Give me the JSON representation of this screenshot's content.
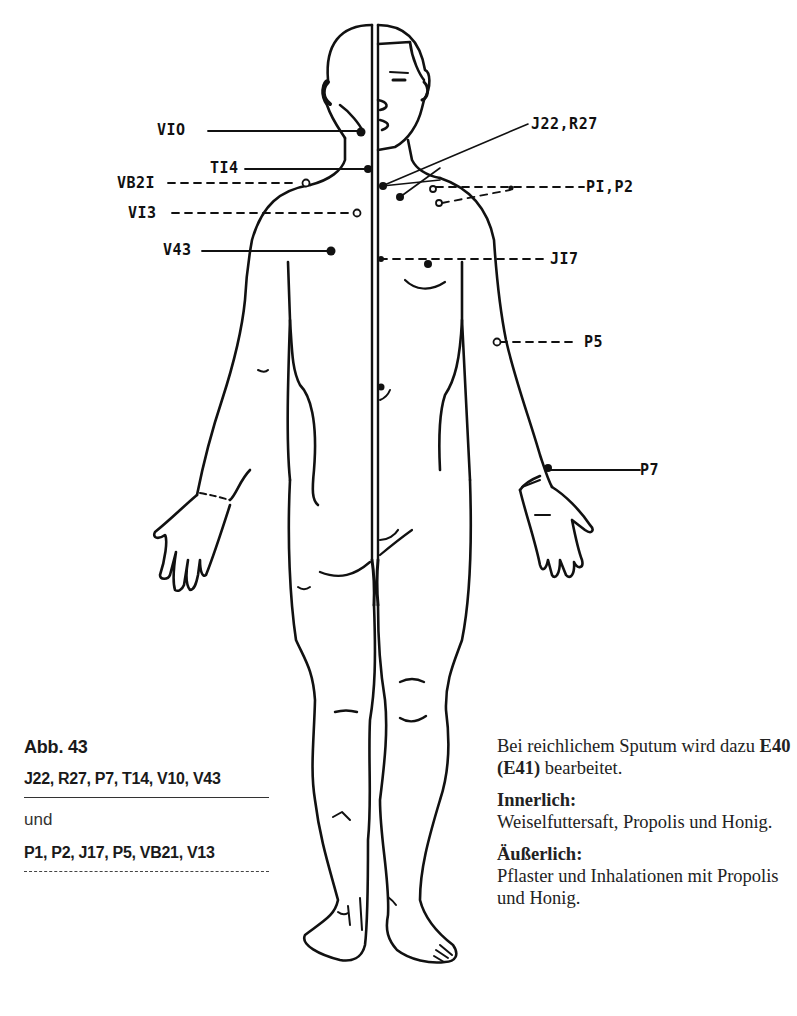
{
  "figure": {
    "labels": {
      "v10": "VIO",
      "ti4": "TI4",
      "vb21": "VB2I",
      "vi3": "VI3",
      "v43": "V43",
      "j22_r27": "J22,R27",
      "p1_p2": "PI,P2",
      "j17": "JI7",
      "p5": "P5",
      "p7": "P7"
    },
    "line_color": "#111111"
  },
  "caption": {
    "title": "Abb. 43",
    "primary_points": "J22, R27, P7, T14, V10, V43",
    "conjunction": "und",
    "secondary_points": "P1, P2, J17, P5, VB21, V13"
  },
  "side_text": {
    "sputum_line1": "Bei reichlichem Sputum wird dazu ",
    "sputum_bold": "E40 (E41)",
    "sputum_line2": " bearbeitet.",
    "internal_heading": "Innerlich:",
    "internal_text": "Weiselfuttersaft, Propolis und Honig.",
    "external_heading": "Äußerlich:",
    "external_text": "Pflaster und Inhalationen mit Propolis und Honig."
  }
}
